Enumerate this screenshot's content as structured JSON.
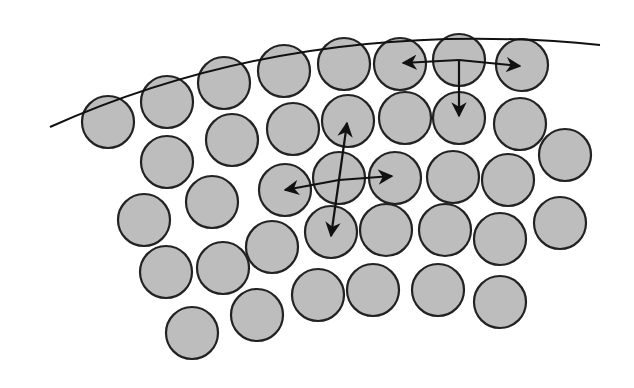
{
  "diagram": {
    "title": "",
    "boundary_curve": {
      "path": "M 50 127 Q 300 15 600 45",
      "stroke": "#111111",
      "width": 2
    },
    "particle_style": {
      "fill": "#bdbdbd",
      "stroke": "#222222",
      "stroke_width": 2.2,
      "radius": 26
    },
    "particles": [
      {
        "cx": 108,
        "cy": 122
      },
      {
        "cx": 167,
        "cy": 102
      },
      {
        "cx": 224,
        "cy": 83
      },
      {
        "cx": 284,
        "cy": 71
      },
      {
        "cx": 344,
        "cy": 64
      },
      {
        "cx": 400,
        "cy": 64
      },
      {
        "cx": 459,
        "cy": 60
      },
      {
        "cx": 522,
        "cy": 65
      },
      {
        "cx": 167,
        "cy": 162
      },
      {
        "cx": 232,
        "cy": 140
      },
      {
        "cx": 293,
        "cy": 129
      },
      {
        "cx": 348,
        "cy": 121
      },
      {
        "cx": 405,
        "cy": 118
      },
      {
        "cx": 459,
        "cy": 118
      },
      {
        "cx": 520,
        "cy": 124
      },
      {
        "cx": 565,
        "cy": 155
      },
      {
        "cx": 212,
        "cy": 202
      },
      {
        "cx": 285,
        "cy": 190
      },
      {
        "cx": 339,
        "cy": 178
      },
      {
        "cx": 395,
        "cy": 178
      },
      {
        "cx": 453,
        "cy": 177
      },
      {
        "cx": 508,
        "cy": 180
      },
      {
        "cx": 144,
        "cy": 220
      },
      {
        "cx": 272,
        "cy": 247
      },
      {
        "cx": 331,
        "cy": 232
      },
      {
        "cx": 386,
        "cy": 230
      },
      {
        "cx": 445,
        "cy": 230
      },
      {
        "cx": 500,
        "cy": 239
      },
      {
        "cx": 560,
        "cy": 223
      },
      {
        "cx": 166,
        "cy": 272
      },
      {
        "cx": 223,
        "cy": 268
      },
      {
        "cx": 318,
        "cy": 295
      },
      {
        "cx": 373,
        "cy": 290
      },
      {
        "cx": 438,
        "cy": 290
      },
      {
        "cx": 500,
        "cy": 302
      },
      {
        "cx": 192,
        "cy": 333
      },
      {
        "cx": 257,
        "cy": 315
      }
    ],
    "arrows": [
      {
        "name": "surface-arrow-left",
        "x1": 459,
        "y1": 60,
        "x2": 403,
        "y2": 63
      },
      {
        "name": "surface-arrow-right",
        "x1": 459,
        "y1": 60,
        "x2": 520,
        "y2": 66
      },
      {
        "name": "surface-arrow-down",
        "x1": 459,
        "y1": 60,
        "x2": 459,
        "y2": 116
      },
      {
        "name": "bulk-arrow-left",
        "x1": 339,
        "y1": 180,
        "x2": 285,
        "y2": 190
      },
      {
        "name": "bulk-arrow-right",
        "x1": 339,
        "y1": 180,
        "x2": 392,
        "y2": 176
      },
      {
        "name": "bulk-arrow-up",
        "x1": 339,
        "y1": 180,
        "x2": 347,
        "y2": 123
      },
      {
        "name": "bulk-arrow-down",
        "x1": 339,
        "y1": 180,
        "x2": 331,
        "y2": 236
      }
    ],
    "arrow_color": "#111111"
  }
}
